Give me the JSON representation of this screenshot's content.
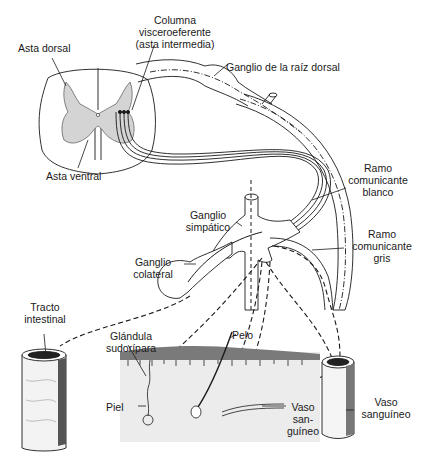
{
  "diagram": {
    "type": "anatomical illustration",
    "labels": {
      "asta_dorsal": "Asta dorsal",
      "columna_1": "Columna",
      "columna_2": "visceroeferente",
      "columna_3": "(asta intermedia)",
      "ganglio_raiz_dorsal": "Ganglio de la raíz dorsal",
      "asta_ventral": "Asta ventral",
      "ramo_blanco_1": "Ramo",
      "ramo_blanco_2": "comunicante",
      "ramo_blanco_3": "blanco",
      "ganglio_simpatico_1": "Ganglio",
      "ganglio_simpatico_2": "simpático",
      "ramo_gris_1": "Ramo",
      "ramo_gris_2": "comunicante",
      "ramo_gris_3": "gris",
      "ganglio_colateral_1": "Ganglio",
      "ganglio_colateral_2": "colateral",
      "tracto_1": "Tracto",
      "tracto_2": "intestinal",
      "glandula_1": "Glándula",
      "glandula_2": "sudorípara",
      "pelo": "Pelo",
      "piel": "Piel",
      "vaso_small_1": "Vaso",
      "vaso_small_2": "san-",
      "vaso_small_3": "guíneo",
      "vaso_large_1": "Vaso",
      "vaso_large_2": "sanguíneo"
    },
    "colors": {
      "line": "#1a1a1a",
      "gray_matter": "#d4d4d4",
      "skin": "#ececec",
      "epidermis": "#7a7a7a"
    }
  }
}
